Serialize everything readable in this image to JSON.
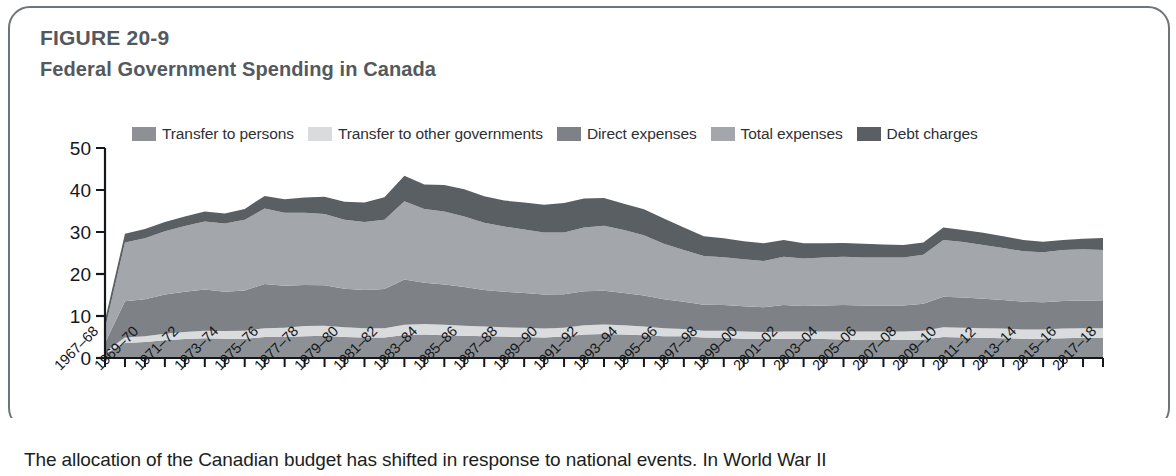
{
  "figure": {
    "label": "FIGURE 20-9",
    "title": "Federal Government Spending in Canada",
    "caption": "The allocation of the Canadian budget has shifted in response to national events. In World War II"
  },
  "colors": {
    "transfer_to_persons": "#8d9196",
    "transfer_to_other_governments": "#d9dbdc",
    "direct_expenses": "#7e8287",
    "total_expenses": "#a3a7ab",
    "debt_charges": "#5a5f64",
    "axis": "#15181b",
    "panel_border": "#6f7478",
    "title_text": "#54595e",
    "label_text": "#15181b"
  },
  "chart_data": {
    "type": "area",
    "stacked": true,
    "title": "Federal Government Spending in Canada",
    "xlabel": "",
    "ylabel": "",
    "ylim": [
      0,
      50
    ],
    "yticks": [
      0,
      10,
      20,
      30,
      40,
      50
    ],
    "grid": false,
    "legend_position": "top",
    "categories": [
      "1967-68",
      "1968-69",
      "1969-70",
      "1970-71",
      "1971-72",
      "1972-73",
      "1973-74",
      "1974-75",
      "1975-76",
      "1976-77",
      "1977-78",
      "1978-79",
      "1979-80",
      "1980-81",
      "1981-82",
      "1982-83",
      "1983-84",
      "1984-85",
      "1985-86",
      "1986-87",
      "1987-88",
      "1988-89",
      "1989-90",
      "1990-91",
      "1991-92",
      "1992-93",
      "1993-94",
      "1994-95",
      "1995-96",
      "1996-97",
      "1997-98",
      "1998-99",
      "1999-00",
      "2000-01",
      "2001-02",
      "2002-03",
      "2003-04",
      "2004-05",
      "2005-06",
      "2006-07",
      "2007-08",
      "2008-09",
      "2009-10",
      "2010-11",
      "2011-12",
      "2012-13",
      "2013-14",
      "2014-15",
      "2015-16",
      "2016-17",
      "2017-18"
    ],
    "tick_labels": [
      "1967-68",
      "1969-70",
      "1971-72",
      "1973-74",
      "1975-76",
      "1977-78",
      "1979-80",
      "1981-82",
      "1983-84",
      "1985-86",
      "1987-88",
      "1989-90",
      "1991-92",
      "1993-94",
      "1995-96",
      "1997-98",
      "1999-00",
      "2001-02",
      "2003-04",
      "2005-06",
      "2007-08",
      "2009-10",
      "2011-12",
      "2013-14",
      "2015-16",
      "2017-18"
    ],
    "series": [
      {
        "name": "Transfer to persons",
        "color": "#8d9196",
        "values": [
          1.0,
          3.6,
          3.8,
          4.2,
          4.5,
          4.7,
          4.6,
          4.6,
          5.0,
          5.0,
          5.2,
          5.3,
          5.0,
          4.9,
          4.9,
          5.5,
          5.6,
          5.4,
          5.3,
          5.2,
          5.1,
          5.0,
          4.9,
          5.1,
          5.6,
          5.7,
          5.6,
          5.4,
          5.2,
          5.2,
          4.9,
          4.8,
          4.6,
          4.5,
          4.6,
          4.5,
          4.5,
          4.4,
          4.3,
          4.3,
          4.3,
          4.4,
          5.0,
          4.9,
          4.8,
          4.7,
          4.6,
          4.6,
          4.7,
          4.8,
          4.8
        ]
      },
      {
        "name": "Transfer to other governments",
        "color": "#d9dbdc",
        "values": [
          0.4,
          1.3,
          1.4,
          1.6,
          1.7,
          1.8,
          1.8,
          1.9,
          2.1,
          2.2,
          2.4,
          2.4,
          2.3,
          2.2,
          2.2,
          2.4,
          2.5,
          2.5,
          2.4,
          2.3,
          2.2,
          2.2,
          2.1,
          2.1,
          2.2,
          2.3,
          2.2,
          2.1,
          1.9,
          1.7,
          1.6,
          1.7,
          1.7,
          1.7,
          1.7,
          1.8,
          1.8,
          1.9,
          2.0,
          2.0,
          2.0,
          2.1,
          2.3,
          2.3,
          2.3,
          2.3,
          2.2,
          2.2,
          2.3,
          2.3,
          2.3
        ]
      },
      {
        "name": "Direct expenses",
        "color": "#7e8287",
        "values": [
          2.2,
          8.6,
          8.8,
          9.3,
          9.6,
          9.8,
          9.4,
          9.6,
          10.5,
          10.0,
          9.8,
          9.6,
          9.2,
          9.1,
          9.3,
          10.8,
          9.8,
          9.6,
          9.2,
          8.7,
          8.5,
          8.3,
          8.1,
          8.0,
          8.1,
          8.0,
          7.7,
          7.4,
          6.9,
          6.5,
          6.2,
          6.1,
          6.0,
          5.9,
          6.3,
          6.1,
          6.2,
          6.3,
          6.2,
          6.2,
          6.2,
          6.4,
          7.3,
          7.2,
          7.0,
          6.8,
          6.6,
          6.5,
          6.6,
          6.6,
          6.5
        ]
      },
      {
        "name": "Total expenses",
        "color": "#a3a7ab",
        "values": [
          3.4,
          14.0,
          14.5,
          15.1,
          15.6,
          16.2,
          16.2,
          16.8,
          18.0,
          17.4,
          17.2,
          17.0,
          16.4,
          16.2,
          16.5,
          18.6,
          17.6,
          17.4,
          16.8,
          16.0,
          15.5,
          15.1,
          14.8,
          14.7,
          15.2,
          15.5,
          15.0,
          14.3,
          13.2,
          12.3,
          11.6,
          11.4,
          11.2,
          11.0,
          11.5,
          11.3,
          11.4,
          11.5,
          11.4,
          11.4,
          11.4,
          11.7,
          13.5,
          13.2,
          12.8,
          12.4,
          12.0,
          11.9,
          12.1,
          12.2,
          12.1
        ]
      },
      {
        "name": "Debt charges",
        "color": "#5a5f64",
        "values": [
          2.0,
          2.1,
          2.2,
          2.2,
          2.3,
          2.4,
          2.4,
          2.6,
          3.0,
          3.2,
          3.6,
          4.1,
          4.3,
          4.6,
          5.4,
          6.1,
          5.8,
          6.3,
          6.5,
          6.3,
          6.2,
          6.4,
          6.6,
          7.0,
          6.9,
          6.6,
          6.2,
          6.2,
          6.0,
          5.4,
          4.7,
          4.5,
          4.3,
          4.2,
          4.0,
          3.6,
          3.4,
          3.3,
          3.3,
          3.1,
          3.0,
          2.9,
          3.0,
          2.9,
          2.9,
          2.8,
          2.7,
          2.5,
          2.4,
          2.5,
          2.9
        ]
      }
    ],
    "totals_note": "Values are percent of GDP; stacked area totals peak near 45 in 1982-83"
  }
}
